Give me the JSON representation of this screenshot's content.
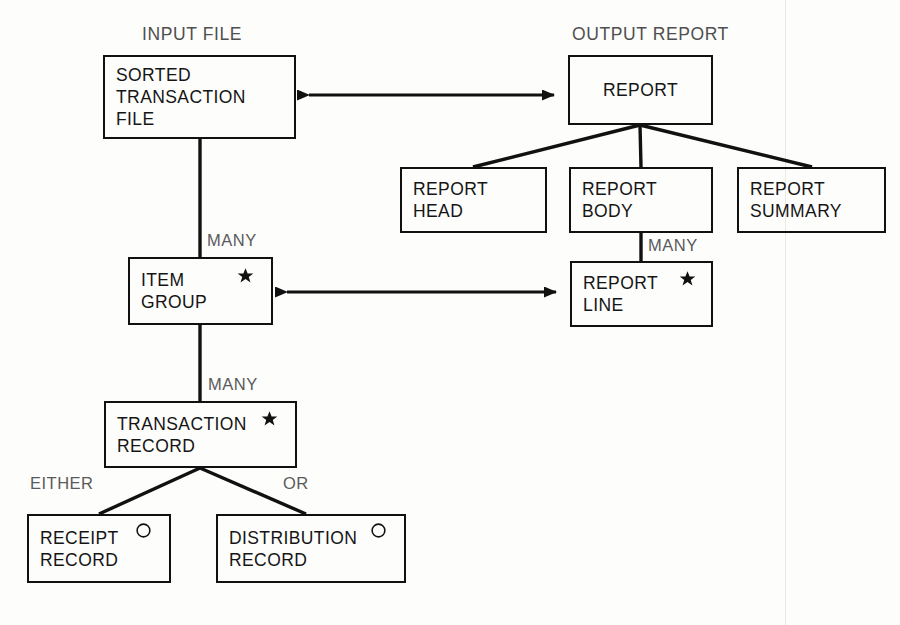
{
  "diagram": {
    "group_labels": [
      {
        "id": "input-file",
        "text": "INPUT FILE",
        "x": 142,
        "y": 24
      },
      {
        "id": "output-report",
        "text": "OUTPUT REPORT",
        "x": 572,
        "y": 24
      }
    ],
    "boxes": [
      {
        "id": "sorted-transaction-file",
        "lines": "SORTED\nTRANSACTION\nFILE",
        "align": "left",
        "x": 103,
        "y": 55,
        "w": 193,
        "h": 84,
        "marker": "none"
      },
      {
        "id": "report",
        "lines": "REPORT",
        "align": "center",
        "x": 568,
        "y": 55,
        "w": 145,
        "h": 70,
        "marker": "none"
      },
      {
        "id": "report-head",
        "lines": "REPORT\nHEAD",
        "align": "left",
        "x": 400,
        "y": 167,
        "w": 147,
        "h": 66,
        "marker": "none"
      },
      {
        "id": "report-body",
        "lines": "REPORT\nBODY",
        "align": "left",
        "x": 569,
        "y": 167,
        "w": 144,
        "h": 66,
        "marker": "none"
      },
      {
        "id": "report-summary",
        "lines": "REPORT\nSUMMARY",
        "align": "left",
        "x": 737,
        "y": 167,
        "w": 149,
        "h": 66,
        "marker": "none"
      },
      {
        "id": "item-group",
        "lines": "ITEM\nGROUP",
        "align": "left",
        "x": 128,
        "y": 257,
        "w": 145,
        "h": 68,
        "marker": "star",
        "marker_x": 107,
        "marker_y": 8
      },
      {
        "id": "report-line",
        "lines": "REPORT\nLINE",
        "align": "left",
        "x": 570,
        "y": 261,
        "w": 143,
        "h": 66,
        "marker": "star",
        "marker_x": 107,
        "marker_y": 7
      },
      {
        "id": "transaction-record",
        "lines": "TRANSACTION\nRECORD",
        "align": "left",
        "x": 104,
        "y": 401,
        "w": 193,
        "h": 67,
        "marker": "star",
        "marker_x": 155,
        "marker_y": 7
      },
      {
        "id": "receipt-record",
        "lines": "RECEIPT\nRECORD",
        "align": "left",
        "x": 27,
        "y": 514,
        "w": 144,
        "h": 69,
        "marker": "circle",
        "marker_x": 106,
        "marker_y": 6
      },
      {
        "id": "distribution-record",
        "lines": "DISTRIBUTION\nRECORD",
        "align": "left",
        "x": 216,
        "y": 514,
        "w": 190,
        "h": 69,
        "marker": "circle",
        "marker_x": 152,
        "marker_y": 6
      }
    ],
    "cardinality_labels": [
      {
        "id": "many-item-group",
        "text": "MANY",
        "x": 207,
        "y": 231
      },
      {
        "id": "many-report-line",
        "text": "MANY",
        "x": 648,
        "y": 236
      },
      {
        "id": "many-transaction-record",
        "text": "MANY",
        "x": 208,
        "y": 375
      },
      {
        "id": "either-receipt",
        "text": "EITHER",
        "x": 30,
        "y": 474
      },
      {
        "id": "or-distribution",
        "text": "OR",
        "x": 283,
        "y": 474
      }
    ],
    "connectors": [
      {
        "id": "sorted-file-to-item-group",
        "kind": "vertical",
        "x": 200,
        "y1": 139,
        "y2": 257
      },
      {
        "id": "item-group-to-transaction-record",
        "kind": "vertical",
        "x": 200,
        "y1": 325,
        "y2": 401
      },
      {
        "id": "report-body-to-report-line",
        "kind": "vertical",
        "x": 641,
        "y1": 233,
        "y2": 261
      },
      {
        "id": "report-to-report-head",
        "kind": "branch",
        "x1": 640,
        "y1": 125,
        "x2": 473,
        "y2": 167
      },
      {
        "id": "report-to-report-body",
        "kind": "branch",
        "x1": 640,
        "y1": 125,
        "x2": 641,
        "y2": 167
      },
      {
        "id": "report-to-report-summary",
        "kind": "branch",
        "x1": 640,
        "y1": 125,
        "x2": 812,
        "y2": 167
      },
      {
        "id": "transaction-record-to-receipt",
        "kind": "branch",
        "x1": 200,
        "y1": 468,
        "x2": 99,
        "y2": 514
      },
      {
        "id": "transaction-record-to-distribution",
        "kind": "branch",
        "x1": 200,
        "y1": 468,
        "x2": 306,
        "y2": 514
      }
    ],
    "arrows": [
      {
        "id": "sorted-file-report-arrow",
        "x1": 296,
        "x2": 567,
        "y": 95
      },
      {
        "id": "item-group-report-line-arrow",
        "x1": 274,
        "x2": 569,
        "y": 292
      }
    ],
    "colors": {
      "line": "#111111",
      "box_text": "#151515",
      "group_label": "#4f4f4f",
      "cardinality_label": "#5a5a5a",
      "background": "#fdfdfc"
    }
  }
}
